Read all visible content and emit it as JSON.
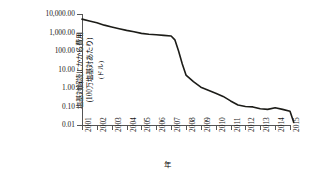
{
  "chart_data": {
    "type": "line",
    "title": "",
    "subtitle": "",
    "xlabel": "年",
    "ylabel_lines": [
      "塩基対解読にかかる費用",
      "(100万塩基対あたり)",
      "(ドル)"
    ],
    "ylabel": "塩基対解読にかかる費用 (100万塩基対あたり) (ドル)",
    "yscale": "log",
    "ylim": [
      0.01,
      10000
    ],
    "ytick_labels": [
      "10,000.00",
      "1,000.00",
      "100.00",
      "10.00",
      "1.00",
      "0.10",
      "0.01"
    ],
    "ytick_values": [
      10000,
      1000,
      100,
      10,
      1,
      0.1,
      0.01
    ],
    "xlim": [
      2001,
      2015
    ],
    "xtick_labels": [
      "2001",
      "2002",
      "2003",
      "2004",
      "2005",
      "2006",
      "2007",
      "2008",
      "2009",
      "2010",
      "2011",
      "2012",
      "2013",
      "2014",
      "2015"
    ],
    "grid": false,
    "legend": "none",
    "line_color": "#1c1c18",
    "series": [
      {
        "name": "塩基対解読にかかる費用",
        "x": [
          2001,
          2001.5,
          2002,
          2002.5,
          2003,
          2003.5,
          2004,
          2004.5,
          2005,
          2005.5,
          2006,
          2006.5,
          2007,
          2007.25,
          2007.5,
          2007.75,
          2008,
          2008.5,
          2009,
          2009.5,
          2010,
          2010.5,
          2011,
          2011.5,
          2012,
          2012.5,
          2013,
          2013.5,
          2014,
          2014.5,
          2015,
          2015.25
        ],
        "values": [
          5300,
          4200,
          3400,
          2500,
          2000,
          1600,
          1300,
          1100,
          900,
          800,
          750,
          700,
          650,
          400,
          100,
          20,
          5,
          2.2,
          1.1,
          0.75,
          0.52,
          0.35,
          0.2,
          0.12,
          0.1,
          0.095,
          0.075,
          0.07,
          0.085,
          0.07,
          0.055,
          0.014
        ]
      }
    ]
  }
}
